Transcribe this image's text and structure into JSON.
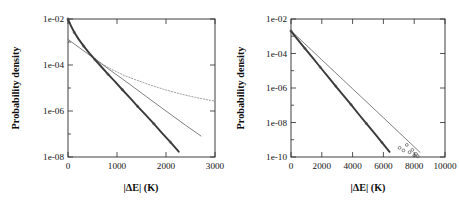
{
  "figure": {
    "background": "#ffffff",
    "panel_count": 2
  },
  "chart_data": [
    {
      "panel": "left",
      "type": "line",
      "title": "",
      "xlabel": "|ΔE| (K)",
      "ylabel": "Probability density",
      "xlim": [
        0,
        3000
      ],
      "ylim": [
        1e-08,
        0.01
      ],
      "yscale": "log",
      "xscale": "linear",
      "grid": false,
      "legend": "none",
      "xticks": [
        0,
        1000,
        2000,
        3000
      ],
      "xticklabels": [
        "0",
        "1000",
        "2000",
        "3000"
      ],
      "yticks": [
        0.01,
        0.0001,
        1e-06,
        1e-08
      ],
      "yticklabels": [
        "1e-02",
        "1e-04",
        "1e-06",
        "1e-08"
      ],
      "series": [
        {
          "name": "simulation-data",
          "style": "circles-with-thick-line",
          "x": [
            0,
            60,
            130,
            220,
            320,
            430,
            550,
            680,
            820,
            960,
            1110,
            1260,
            1420,
            1580,
            1750,
            1920,
            2090,
            2260,
            2430,
            2560,
            2650,
            2720
          ],
          "y": [
            0.01,
            0.005,
            0.0026,
            0.0013,
            0.00066,
            0.00034,
            0.00017,
            8.4e-05,
            3.9e-05,
            1.9e-05,
            8.4e-06,
            3.8e-06,
            1.6e-06,
            6.9e-07,
            2.8e-07,
            1.1e-07,
            4.4e-08,
            1.7e-08,
            6.6e-09,
            3e-09,
            1.6e-09,
            1e-09
          ]
        },
        {
          "name": "exponential-fit",
          "style": "thin-solid-line",
          "x": [
            0,
            400,
            800,
            1200,
            1600,
            2000,
            2400,
            2720
          ],
          "y": [
            0.0013,
            0.00031,
            7.4e-05,
            1.8e-05,
            4.2e-06,
            1e-06,
            2.4e-07,
            8e-08
          ]
        },
        {
          "name": "model-curve",
          "style": "dotted-line",
          "x": [
            0,
            150,
            320,
            500,
            700,
            900,
            1150,
            1400,
            1700,
            2000,
            2300,
            2600,
            2900,
            3000
          ],
          "y": [
            0.01,
            0.0022,
            0.00065,
            0.00024,
            0.00011,
            6.3e-05,
            3.5e-05,
            2.2e-05,
            1.3e-05,
            8.2e-06,
            5.5e-06,
            3.9e-06,
            2.9e-06,
            2.7e-06
          ]
        }
      ]
    },
    {
      "panel": "right",
      "type": "line",
      "title": "",
      "xlabel": "|ΔE| (K)",
      "ylabel": "Probability density",
      "xlim": [
        0,
        10000
      ],
      "ylim": [
        1e-10,
        0.01
      ],
      "yscale": "log",
      "xscale": "linear",
      "grid": false,
      "legend": "none",
      "xticks": [
        0,
        2000,
        4000,
        6000,
        8000,
        10000
      ],
      "xticklabels": [
        "0",
        "2000",
        "4000",
        "6000",
        "8000",
        "10000"
      ],
      "yticks": [
        0.01,
        0.0001,
        1e-06,
        1e-08,
        1e-10
      ],
      "yticklabels": [
        "1e-02",
        "1e-04",
        "1e-06",
        "1e-08",
        "1e-10"
      ],
      "series": [
        {
          "name": "simulation-data",
          "style": "circles-with-thick-line",
          "x": [
            0,
            400,
            900,
            1400,
            1900,
            2400,
            2900,
            3400,
            3900,
            4400,
            4900,
            5400,
            5900,
            6400,
            6900,
            7200,
            7500,
            7750,
            7950,
            8100,
            8250,
            8350
          ],
          "y": [
            0.002,
            0.0007,
            0.0002,
            5.7e-05,
            1.6e-05,
            4.6e-06,
            1.3e-06,
            3.7e-07,
            1.1e-07,
            3e-08,
            8.6e-09,
            2.5e-09,
            7e-10,
            2e-10,
            6e-11,
            3.2e-11,
            1.7e-11,
            1e-11,
            6.5e-12,
            4.5e-12,
            3.2e-12,
            2.5e-12
          ]
        },
        {
          "name": "exponential-fit",
          "style": "thin-solid-line",
          "x": [
            0,
            2000,
            4000,
            6000,
            8000,
            8400
          ],
          "y": [
            0.0021,
            4.3e-05,
            9e-07,
            1.9e-08,
            3.9e-10,
            1.8e-10
          ]
        }
      ],
      "scatter_outliers": {
        "name": "tail-outlier-markers",
        "x": [
          7050,
          7300,
          7520,
          7700,
          7880,
          8000,
          8120,
          8230
        ],
        "y": [
          3.4e-10,
          2.4e-10,
          5e-10,
          1.9e-10,
          2.6e-10,
          1.2e-10,
          1.5e-10,
          1.1e-10
        ]
      }
    }
  ]
}
